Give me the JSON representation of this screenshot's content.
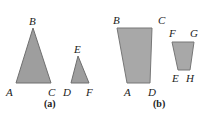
{
  "figure_a": {
    "caption": "(a)",
    "triangle_large": {
      "labels": {
        "A": "A",
        "B": "B",
        "C": "C"
      }
    },
    "triangle_small": {
      "labels": {
        "D": "D",
        "E": "E",
        "F": "F"
      }
    }
  },
  "figure_b": {
    "caption": "(b)",
    "trapezoid_large": {
      "labels": {
        "A": "A",
        "B": "B",
        "C": "C",
        "D": "D"
      }
    },
    "trapezoid_small": {
      "labels": {
        "E": "E",
        "F": "F",
        "G": "G",
        "H": "H"
      }
    }
  },
  "colors": {
    "fill": "#9e9e9e",
    "stroke": "#6f6f6f"
  }
}
